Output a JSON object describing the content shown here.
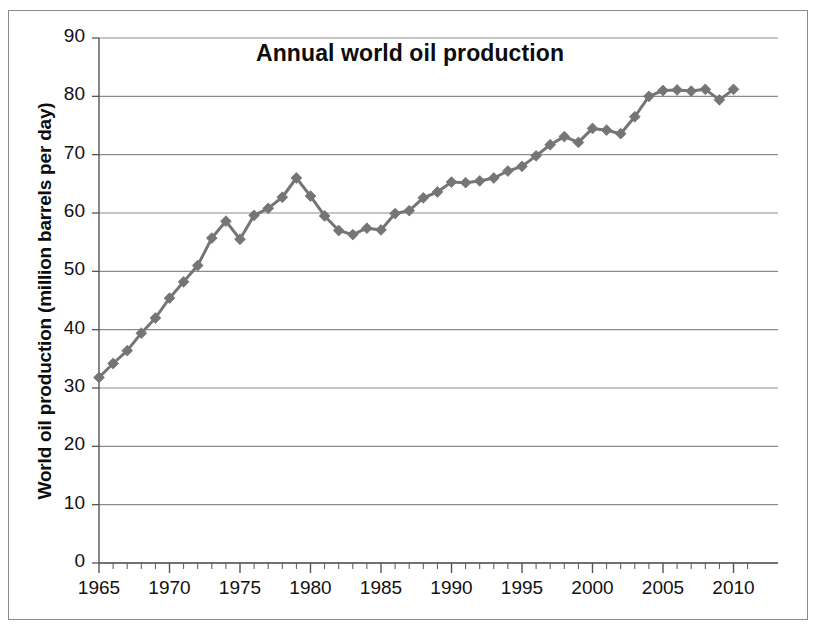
{
  "figure": {
    "background_color": "#ffffff",
    "border_color": "#8a8a8a"
  },
  "chart_data": {
    "type": "line",
    "title": "Annual world oil production",
    "xlabel": "",
    "ylabel": "World oil production (million barrels per day)",
    "xlim": [
      1965,
      2011
    ],
    "ylim": [
      0,
      90
    ],
    "ytick_labels": [
      "0",
      "10",
      "20",
      "30",
      "40",
      "50",
      "60",
      "70",
      "80",
      "90"
    ],
    "ytick_values": [
      0,
      10,
      20,
      30,
      40,
      50,
      60,
      70,
      80,
      90
    ],
    "xtick_labels": [
      "1965",
      "1970",
      "1975",
      "1980",
      "1985",
      "1990",
      "1995",
      "2000",
      "2005",
      "2010"
    ],
    "xtick_values": [
      1965,
      1970,
      1975,
      1980,
      1985,
      1990,
      1995,
      2000,
      2005,
      2010
    ],
    "xminor_step": 1,
    "grid": "horizontal",
    "legend": "none",
    "marker": "diamond",
    "series_color": "#757575",
    "x": [
      1965,
      1966,
      1967,
      1968,
      1969,
      1970,
      1971,
      1972,
      1973,
      1974,
      1975,
      1976,
      1977,
      1978,
      1979,
      1980,
      1981,
      1982,
      1983,
      1984,
      1985,
      1986,
      1987,
      1988,
      1989,
      1990,
      1991,
      1992,
      1993,
      1994,
      1995,
      1996,
      1997,
      1998,
      1999,
      2000,
      2001,
      2002,
      2003,
      2004,
      2005,
      2006,
      2007,
      2008,
      2009,
      2010
    ],
    "values": [
      31.8,
      34.2,
      36.4,
      39.4,
      42.0,
      45.4,
      48.2,
      51.0,
      55.7,
      58.6,
      55.5,
      59.6,
      60.8,
      62.7,
      66.0,
      62.9,
      59.5,
      57.0,
      56.3,
      57.4,
      57.1,
      59.9,
      60.4,
      62.6,
      63.6,
      65.3,
      65.2,
      65.5,
      66.0,
      67.2,
      68.0,
      69.8,
      71.7,
      73.1,
      72.1,
      74.5,
      74.2,
      73.6,
      76.5,
      80.0,
      81.0,
      81.1,
      80.9,
      81.2,
      79.4,
      81.2
    ]
  }
}
